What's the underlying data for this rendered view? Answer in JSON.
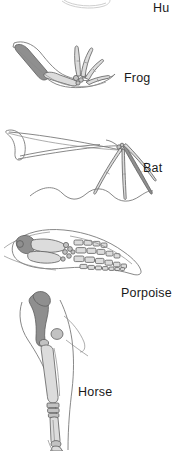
{
  "figure": {
    "background_color": "#ffffff",
    "bone_fill_dark": "#8c8c8c",
    "bone_fill_light": "#d8d8d8",
    "outline_color": "#5a5a5a",
    "label_color": "#1a1a1a"
  },
  "labels": {
    "human": "Hu",
    "frog": "Frog",
    "bat": "Bat",
    "porpoise": "Porpoise",
    "horse": "Horse"
  },
  "panels": [
    {
      "id": "human",
      "label": "Hu",
      "note": "cut off at top edge of image; only lower outline arc visible"
    },
    {
      "id": "frog",
      "label": "Frog",
      "note": "bent forelimb, shaded humerus, splayed elongated digits"
    },
    {
      "id": "bat",
      "label": "Bat",
      "note": "wing with elongated finger bones radiating from wrist, scalloped membrane"
    },
    {
      "id": "porpoise",
      "label": "Porpoise",
      "note": "flipper with humerus, radius/ulna, carpals and rows of rectangular phalanges"
    },
    {
      "id": "horse",
      "label": "Horse",
      "note": "elongated leg with shaded humerus, fused cannon bone down to hoof"
    }
  ]
}
